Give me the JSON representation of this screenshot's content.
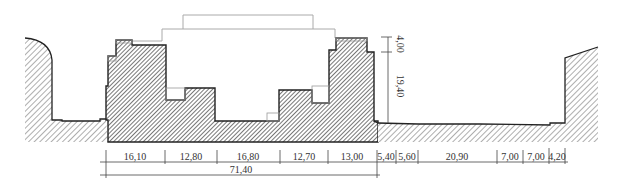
{
  "drawing": {
    "type": "architectural-cross-section",
    "colors": {
      "outline": "#222222",
      "hatch_light": "#9a9a9a",
      "hatch_dark": "#555555",
      "ghost_line": "#aaaaaa",
      "dim_line": "#444444"
    },
    "horizontal_dimensions": [
      {
        "label": "16,10",
        "x1": 106,
        "x2": 165
      },
      {
        "label": "12,80",
        "x1": 165,
        "x2": 217
      },
      {
        "label": "16,80",
        "x1": 217,
        "x2": 280
      },
      {
        "label": "12,70",
        "x1": 280,
        "x2": 328
      },
      {
        "label": "13,00",
        "x1": 328,
        "x2": 377
      },
      {
        "label": "5,40",
        "x1": 377,
        "x2": 396
      },
      {
        "label": "5,60",
        "x1": 396,
        "x2": 418
      },
      {
        "label": "20,90",
        "x1": 418,
        "x2": 497
      },
      {
        "label": "7,00",
        "x1": 497,
        "x2": 523
      },
      {
        "label": "7,00",
        "x1": 523,
        "x2": 549
      },
      {
        "label": "4,20",
        "x1": 549,
        "x2": 565
      }
    ],
    "total_dimension": {
      "label": "71,40",
      "x1": 106,
      "x2": 377
    },
    "vertical_dimensions": [
      {
        "label": "4,00",
        "y1": 37,
        "y2": 52
      },
      {
        "label": "19,40",
        "y1": 52,
        "y2": 123
      }
    ]
  }
}
